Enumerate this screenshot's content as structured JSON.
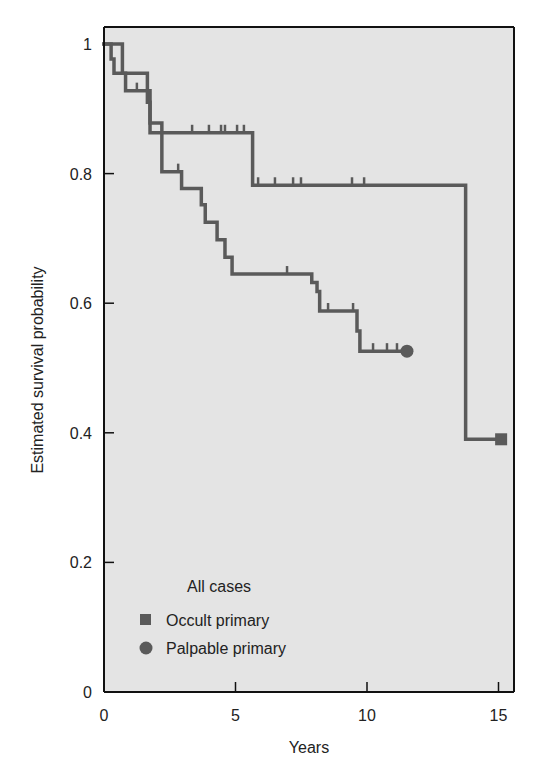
{
  "chart_data": {
    "type": "line",
    "subtype": "kaplan-meier step",
    "title": "",
    "xlabel": "Years",
    "ylabel": "Estimated survival probability",
    "xlim": [
      0,
      15.5
    ],
    "ylim": [
      0,
      1
    ],
    "xticks": [
      0,
      5,
      10,
      15
    ],
    "xtick_labels": [
      "0",
      "5",
      "10",
      "15"
    ],
    "yticks": [
      0,
      0.2,
      0.4,
      0.6,
      0.8,
      1
    ],
    "ytick_labels": [
      "0",
      "0.2",
      "0.4",
      "0.6",
      "0.8",
      "1"
    ],
    "grid": false,
    "plot_background": "#e4e4e4",
    "legend": {
      "title": "All cases",
      "position": "bottom-left",
      "entries": [
        {
          "label": "Occult primary",
          "marker": "square"
        },
        {
          "label": "Palpable primary",
          "marker": "circle"
        }
      ]
    },
    "series": [
      {
        "name": "Occult primary",
        "marker": "square",
        "color": "#5a5a5a",
        "steps": [
          [
            0,
            1.0
          ],
          [
            0.27,
            0.977
          ],
          [
            0.38,
            0.955
          ],
          [
            1.65,
            0.91
          ],
          [
            1.75,
            0.863
          ],
          [
            5.65,
            0.782
          ],
          [
            13.75,
            0.39
          ]
        ],
        "end_x": 15.1,
        "censored_x": [
          3.35,
          3.99,
          4.45,
          4.6,
          5.06,
          5.32,
          5.86,
          6.5,
          7.19,
          7.49,
          9.43,
          9.89
        ]
      },
      {
        "name": "Palpable primary",
        "marker": "circle",
        "color": "#5a5a5a",
        "steps": [
          [
            0,
            1.0
          ],
          [
            0.7,
            0.955
          ],
          [
            0.82,
            0.928
          ],
          [
            1.75,
            0.878
          ],
          [
            2.2,
            0.803
          ],
          [
            2.95,
            0.777
          ],
          [
            3.7,
            0.752
          ],
          [
            3.85,
            0.725
          ],
          [
            4.3,
            0.698
          ],
          [
            4.6,
            0.671
          ],
          [
            4.87,
            0.645
          ],
          [
            7.9,
            0.632
          ],
          [
            8.1,
            0.618
          ],
          [
            8.2,
            0.588
          ],
          [
            9.62,
            0.557
          ],
          [
            9.73,
            0.526
          ]
        ],
        "end_x": 11.52,
        "censored_x": [
          1.25,
          2.82,
          6.96,
          8.52,
          9.47,
          10.23,
          10.76,
          11.14
        ]
      }
    ]
  }
}
